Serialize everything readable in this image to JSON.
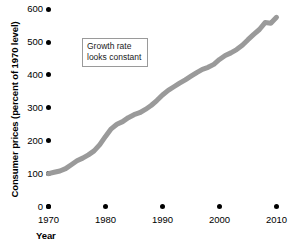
{
  "chart_data": {
    "type": "line",
    "title": "",
    "xlabel": "Year",
    "ylabel": "Consumer prices (percent of 1970 level)",
    "xlim": [
      1970,
      2010
    ],
    "ylim": [
      0,
      600
    ],
    "grid": false,
    "legend": "none",
    "line_color": "#9a9a9a",
    "tick_color": "#000000",
    "xticks": [
      "1970",
      "1980",
      "1990",
      "2000",
      "2010"
    ],
    "xtick_values": [
      1970,
      1980,
      1990,
      2000,
      2010
    ],
    "yticks": [
      "0",
      "100",
      "200",
      "300",
      "400",
      "500",
      "600"
    ],
    "ytick_values": [
      0,
      100,
      200,
      300,
      400,
      500,
      600
    ],
    "series": [
      {
        "name": "Consumer prices",
        "x": [
          1970,
          1971,
          1972,
          1973,
          1974,
          1975,
          1976,
          1977,
          1978,
          1979,
          1980,
          1981,
          1982,
          1983,
          1984,
          1985,
          1986,
          1987,
          1988,
          1989,
          1990,
          1991,
          1992,
          1993,
          1994,
          1995,
          1996,
          1997,
          1998,
          1999,
          2000,
          2001,
          2002,
          2003,
          2004,
          2005,
          2006,
          2007,
          2008,
          2009,
          2010
        ],
        "values": [
          100,
          104,
          108,
          115,
          127,
          139,
          147,
          157,
          169,
          188,
          213,
          236,
          250,
          258,
          270,
          279,
          285,
          295,
          307,
          322,
          339,
          353,
          364,
          375,
          385,
          396,
          407,
          417,
          423,
          432,
          447,
          459,
          467,
          477,
          490,
          507,
          523,
          538,
          559,
          557,
          575
        ]
      }
    ],
    "annotations": [
      {
        "id": "growth-note",
        "line1": "Growth rate",
        "line2": "looks constant"
      }
    ]
  }
}
